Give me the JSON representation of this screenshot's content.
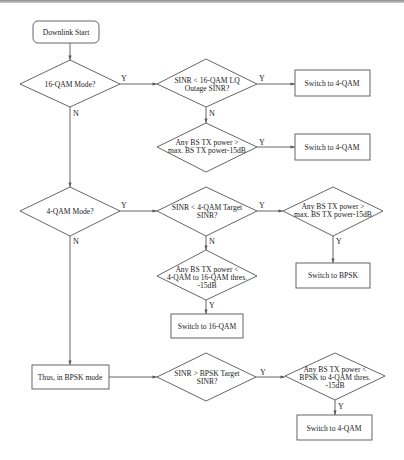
{
  "diagram": {
    "type": "flowchart",
    "colors": {
      "line": "#555555",
      "background": "#ffffff",
      "text": "#222222"
    },
    "nodes": {
      "start": {
        "shape": "rounded-rect",
        "text": [
          "Downlink Start"
        ]
      },
      "q16_mode": {
        "shape": "diamond",
        "text": [
          "16-QAM Mode?"
        ]
      },
      "sinr_16_lq": {
        "shape": "diamond",
        "text": [
          "SINR < 16-QAM LQ",
          "Outage SINR?"
        ]
      },
      "switch_4qam_1": {
        "shape": "rect",
        "text": [
          "Switch to 4-QAM"
        ]
      },
      "tx_gt_max_1": {
        "shape": "diamond",
        "text": [
          "Any BS TX power >",
          "max. BS TX power-15dB"
        ]
      },
      "switch_4qam_2": {
        "shape": "rect",
        "text": [
          "Switch to 4-QAM"
        ]
      },
      "q4_mode": {
        "shape": "diamond",
        "text": [
          "4-QAM Mode?"
        ]
      },
      "sinr_4_target": {
        "shape": "diamond",
        "text": [
          "SINR < 4-QAM Target",
          "SINR?"
        ]
      },
      "tx_gt_max_2": {
        "shape": "diamond",
        "text": [
          "Any BS TX power >",
          "max. BS TX power-15dB"
        ]
      },
      "switch_bpsk": {
        "shape": "rect",
        "text": [
          "Switch to BPSK"
        ]
      },
      "tx_lt_4to16": {
        "shape": "diamond",
        "text": [
          "Any BS TX power <",
          "4-QAM to 16-QAM thres.",
          "-15dB"
        ]
      },
      "switch_16qam": {
        "shape": "rect",
        "text": [
          "Switch to 16-QAM"
        ]
      },
      "bpsk_mode": {
        "shape": "rect",
        "text": [
          "Thus, in BPSK mode"
        ]
      },
      "sinr_bpsk_target": {
        "shape": "diamond",
        "text": [
          "SINR > BPSK Target",
          "SINR?"
        ]
      },
      "tx_lt_bpsk_to_4": {
        "shape": "diamond",
        "text": [
          "Any BS TX power <",
          "BPSK to 4-QAM thres.",
          "-15dB"
        ]
      },
      "switch_4qam_3": {
        "shape": "rect",
        "text": [
          "Switch to 4-QAM"
        ]
      }
    },
    "edge_labels": {
      "yes": "Y",
      "no": "N"
    },
    "edges": [
      {
        "from": "start",
        "to": "q16_mode",
        "label": ""
      },
      {
        "from": "q16_mode",
        "to": "sinr_16_lq",
        "label": "Y"
      },
      {
        "from": "q16_mode",
        "to": "q4_mode",
        "label": "N"
      },
      {
        "from": "sinr_16_lq",
        "to": "switch_4qam_1",
        "label": "Y"
      },
      {
        "from": "sinr_16_lq",
        "to": "tx_gt_max_1",
        "label": "N"
      },
      {
        "from": "tx_gt_max_1",
        "to": "switch_4qam_2",
        "label": "Y"
      },
      {
        "from": "q4_mode",
        "to": "sinr_4_target",
        "label": "Y"
      },
      {
        "from": "q4_mode",
        "to": "bpsk_mode",
        "label": "N"
      },
      {
        "from": "sinr_4_target",
        "to": "tx_gt_max_2",
        "label": "Y"
      },
      {
        "from": "sinr_4_target",
        "to": "tx_lt_4to16",
        "label": "N"
      },
      {
        "from": "tx_gt_max_2",
        "to": "switch_bpsk",
        "label": "Y"
      },
      {
        "from": "tx_lt_4to16",
        "to": "switch_16qam",
        "label": "Y"
      },
      {
        "from": "bpsk_mode",
        "to": "sinr_bpsk_target",
        "label": ""
      },
      {
        "from": "sinr_bpsk_target",
        "to": "tx_lt_bpsk_to_4",
        "label": "Y"
      },
      {
        "from": "tx_lt_bpsk_to_4",
        "to": "switch_4qam_3",
        "label": "Y"
      }
    ]
  }
}
